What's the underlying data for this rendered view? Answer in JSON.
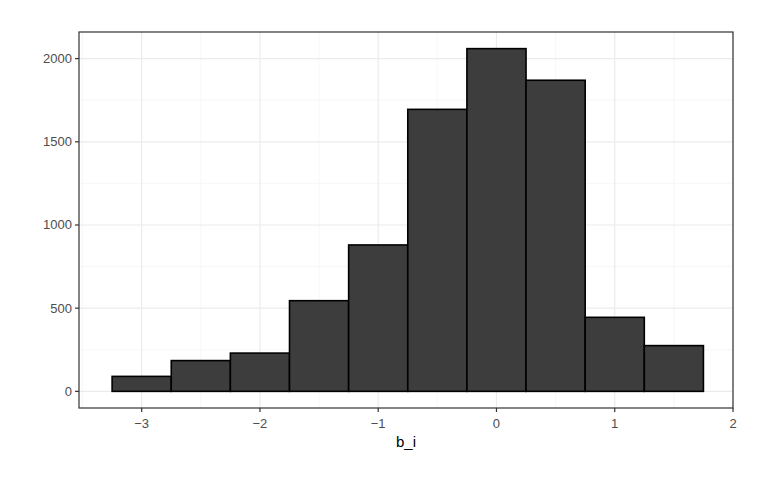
{
  "chart_data": {
    "type": "bar",
    "subtype": "histogram",
    "title": "",
    "xlabel": "b_i",
    "ylabel": "",
    "bin_width": 0.5,
    "bins": [
      {
        "x0": -3.25,
        "x1": -2.75,
        "count": 90
      },
      {
        "x0": -2.75,
        "x1": -2.25,
        "count": 185
      },
      {
        "x0": -2.25,
        "x1": -1.75,
        "count": 230
      },
      {
        "x0": -1.75,
        "x1": -1.25,
        "count": 545
      },
      {
        "x0": -1.25,
        "x1": -0.75,
        "count": 880
      },
      {
        "x0": -0.75,
        "x1": -0.25,
        "count": 1695
      },
      {
        "x0": -0.25,
        "x1": 0.25,
        "count": 2060
      },
      {
        "x0": 0.25,
        "x1": 0.75,
        "count": 1870
      },
      {
        "x0": 0.75,
        "x1": 1.25,
        "count": 445
      },
      {
        "x0": 1.25,
        "x1": 1.75,
        "count": 275
      }
    ],
    "categories": [
      "-3",
      "-2.5",
      "-2",
      "-1.5",
      "-1",
      "-0.5",
      "0",
      "0.5",
      "1",
      "1.5"
    ],
    "values": [
      90,
      185,
      230,
      545,
      880,
      1695,
      2060,
      1870,
      445,
      275
    ],
    "xlim": [
      -3.53,
      2.0
    ],
    "ylim": [
      -100,
      2160
    ],
    "x_ticks": [
      -3,
      -2,
      -1,
      0,
      1,
      2
    ],
    "x_tick_labels": [
      "−3",
      "−2",
      "−1",
      "0",
      "1",
      "2"
    ],
    "y_ticks": [
      0,
      500,
      1000,
      1500,
      2000
    ],
    "y_tick_labels": [
      "0",
      "500",
      "1000",
      "1500",
      "2000"
    ],
    "grid": true,
    "legend": null,
    "colors": {
      "bar_fill": "#3d3d3d",
      "bar_outline": "#000000",
      "panel_border": "#333333",
      "grid_major": "#ebebeb",
      "grid_minor": "#f5f5f5",
      "tick_text": "#4d4d4d"
    }
  }
}
